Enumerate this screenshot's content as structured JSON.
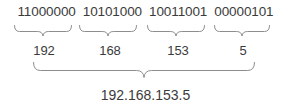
{
  "diagram": {
    "background_color": "#ffffff",
    "text_color": "#3b3b3b",
    "brace_color": "#8d8d8d",
    "binary_octets": [
      "11000000",
      "10101000",
      "10011001",
      "00000101"
    ],
    "decimal_octets": [
      "192",
      "168",
      "153",
      "5"
    ],
    "ip_address": "192.168.153.5"
  }
}
